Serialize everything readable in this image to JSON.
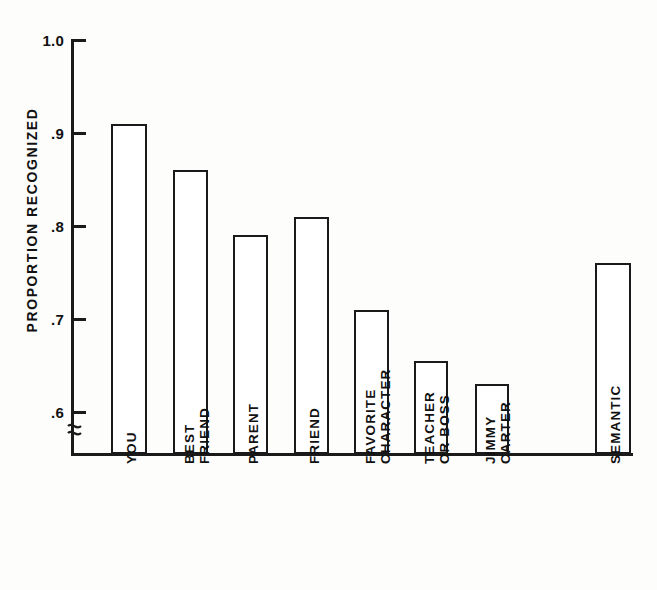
{
  "chart_data": {
    "type": "bar",
    "title": "",
    "subtitle": "",
    "xlabel": "",
    "ylabel": "PROPORTION  RECOGNIZED",
    "ylim": [
      0.555,
      1.0
    ],
    "yticks": [
      "1.0",
      ".9",
      ".8",
      ".7",
      ".6"
    ],
    "ytick_values": [
      1.0,
      0.9,
      0.8,
      0.7,
      0.6
    ],
    "y_axis_break": true,
    "grid": false,
    "legend": null,
    "bar_style": "open outline (white fill, black border)",
    "categories": [
      "YOU",
      "BEST\nFRIEND",
      "PARENT",
      "FRIEND",
      "FAVORITE\nCHARACTER",
      "TEACHER\nOR BOSS",
      "JIMMY\nCARTER",
      "SEMANTIC"
    ],
    "category_lines": [
      [
        "YOU"
      ],
      [
        "BEST",
        "FRIEND"
      ],
      [
        "PARENT"
      ],
      [
        "FRIEND"
      ],
      [
        "FAVORITE",
        "CHARACTER"
      ],
      [
        "TEACHER",
        "OR BOSS"
      ],
      [
        "JIMMY",
        "CARTER"
      ],
      [
        "SEMANTIC"
      ]
    ],
    "values": [
      0.91,
      0.86,
      0.79,
      0.81,
      0.71,
      0.655,
      0.63,
      0.76
    ],
    "gap_before_last_bar": true,
    "colors": {
      "bar_outline": "#1a1a1a",
      "bar_fill": "#ffffff",
      "axis": "#1a1a1a",
      "text": "#111111",
      "background": "#fdfdfc"
    }
  }
}
